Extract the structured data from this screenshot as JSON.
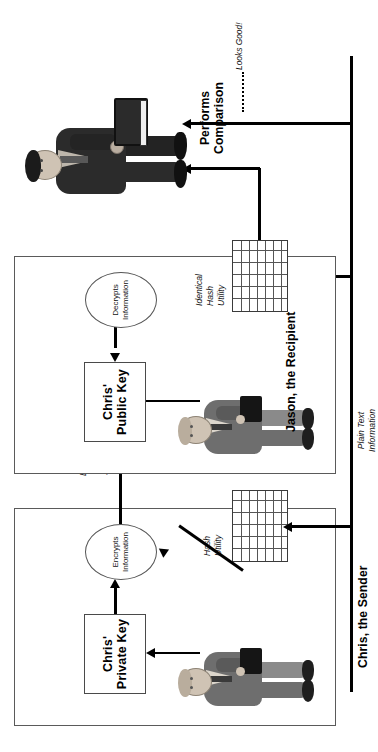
{
  "diagram": {
    "orientation": "rotated-90-ccw",
    "colors": {
      "line": "#000000",
      "panel_border": "#5a5a5a",
      "suit_gray": "#6e6e6e",
      "suit_dark": "#2b2b2b",
      "skin": "#cfc3b4",
      "paper": "#ffffff"
    }
  },
  "sender": {
    "panel_label": "Chris, the Sender",
    "key_box": "Chris'\nPrivate\nKey",
    "process_ellipse": "Encrypts\nInformation",
    "hash_label": "Hash\nUtility",
    "person_name": "chris-sender-figure"
  },
  "recipient": {
    "panel_label": "Jason, the Recipient",
    "key_box": "Chris'\nPublic\nKey",
    "process_ellipse": "Decrypts\nInformation",
    "hash_label": "Identical\nHash\nUtility",
    "person_name": "jason-recipient-figure"
  },
  "channel": {
    "encrypted_label": "Encrypted\nHashed\nSummary",
    "plaintext_label": "Plain Text\nInformation"
  },
  "comparison": {
    "label": "Performs\nComparison",
    "result": "Looks Good!",
    "person_name": "jason-comparison-figure"
  }
}
